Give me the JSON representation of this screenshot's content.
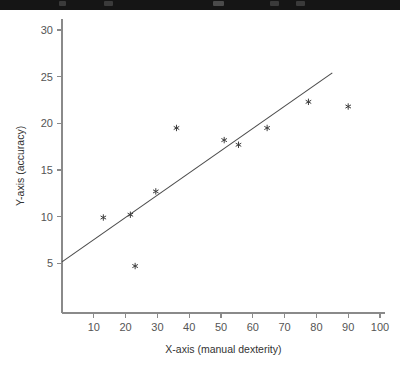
{
  "window": {
    "chrome_strip_color": "#151515"
  },
  "chart_data": {
    "type": "scatter",
    "title": "",
    "subtitle": "",
    "xlabel": "X-axis (manual dexterity)",
    "ylabel": "Y-axis (accuracy)",
    "xlim": [
      0,
      103
    ],
    "ylim": [
      2.5,
      31
    ],
    "xticks": [
      10,
      20,
      30,
      40,
      50,
      60,
      70,
      80,
      90,
      100
    ],
    "xticklabels": [
      "10",
      "20",
      "30",
      "40",
      "50",
      "60",
      "70",
      "80",
      "90",
      "100"
    ],
    "yticks": [
      5,
      10,
      15,
      20,
      25,
      30
    ],
    "yticklabels": [
      "5",
      "10",
      "15",
      "20",
      "25",
      "30"
    ],
    "grid": false,
    "legend": null,
    "marker_style": "asterisk",
    "marker_color": "#3c3c3c",
    "axis_color": "#8a8a8a",
    "points": [
      {
        "x": 13.0,
        "y": 9.9
      },
      {
        "x": 21.5,
        "y": 10.2
      },
      {
        "x": 23.0,
        "y": 4.7
      },
      {
        "x": 29.5,
        "y": 12.7
      },
      {
        "x": 36.0,
        "y": 19.5
      },
      {
        "x": 51.0,
        "y": 18.2
      },
      {
        "x": 55.5,
        "y": 17.7
      },
      {
        "x": 64.5,
        "y": 19.5
      },
      {
        "x": 77.5,
        "y": 22.3
      },
      {
        "x": 90.0,
        "y": 21.8
      }
    ],
    "trendline": {
      "type": "linear-fit",
      "color": "#4a4a4a",
      "x_start": 0.0,
      "y_start": 5.15,
      "x_end": 85.0,
      "y_end": 25.4
    }
  }
}
